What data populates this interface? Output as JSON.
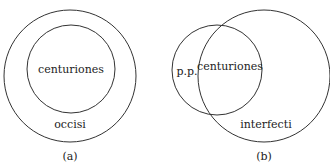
{
  "diagrams": [
    {
      "caption": "(a)",
      "inner_label": "centuriones",
      "outer_label": "occisi",
      "description": "Nested circles: centuriones entirely within occisi"
    },
    {
      "caption": "(b)",
      "left_only_label": "p.p.",
      "overlap_label": "centuriones",
      "right_label": "interfecti",
      "description": "Overlapping circles: p.p. circle partially overlaps interfecti circle"
    }
  ],
  "colors": {
    "stroke": "#333333",
    "text": "#222222",
    "background": "#ffffff"
  }
}
